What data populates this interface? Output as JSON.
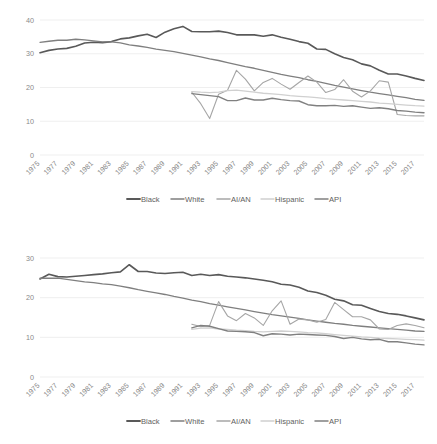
{
  "chart_data": [
    {
      "type": "line",
      "title": "",
      "xlabel": "",
      "ylabel": "",
      "ylim": [
        0,
        40
      ],
      "yticks": [
        0,
        10,
        20,
        30,
        40
      ],
      "grid": true,
      "legend_position": "bottom",
      "x": [
        1975,
        1976,
        1977,
        1978,
        1979,
        1980,
        1981,
        1982,
        1983,
        1984,
        1985,
        1986,
        1987,
        1988,
        1989,
        1990,
        1991,
        1992,
        1993,
        1994,
        1995,
        1996,
        1997,
        1998,
        1999,
        2000,
        2001,
        2002,
        2003,
        2004,
        2005,
        2006,
        2007,
        2008,
        2009,
        2010,
        2011,
        2012,
        2013,
        2014,
        2015,
        2016,
        2017,
        2018
      ],
      "xtick_labels": [
        "1975",
        "1977",
        "1979",
        "1981",
        "1983",
        "1985",
        "1987",
        "1989",
        "1991",
        "1993",
        "1995",
        "1997",
        "1999",
        "2001",
        "2003",
        "2005",
        "2007",
        "2009",
        "2011",
        "2013",
        "2015",
        "2017"
      ],
      "series": [
        {
          "name": "Black",
          "color": "#595959",
          "width": 1.6,
          "values": [
            30.3,
            31.0,
            31.4,
            31.6,
            32.2,
            33.2,
            33.4,
            33.3,
            33.6,
            34.4,
            34.7,
            35.3,
            35.8,
            34.8,
            36.4,
            37.4,
            38.1,
            36.6,
            36.5,
            36.5,
            36.7,
            36.3,
            35.6,
            35.6,
            35.6,
            35.2,
            35.6,
            34.9,
            34.3,
            33.6,
            33.1,
            31.4,
            31.3,
            30.0,
            28.9,
            28.2,
            27.0,
            26.4,
            25.1,
            24.0,
            24.0,
            23.4,
            22.7,
            22.1
          ]
        },
        {
          "name": "White",
          "color": "#7f7f7f",
          "width": 1.3,
          "values": [
            33.4,
            33.7,
            34.0,
            34.0,
            34.3,
            34.1,
            33.8,
            33.5,
            33.5,
            33.2,
            32.6,
            32.3,
            31.9,
            31.4,
            31.0,
            30.6,
            30.1,
            29.6,
            29.1,
            28.5,
            28.0,
            27.4,
            26.8,
            26.2,
            25.7,
            25.1,
            24.5,
            23.9,
            23.4,
            22.9,
            22.3,
            21.8,
            21.2,
            20.6,
            20.1,
            19.6,
            19.1,
            18.6,
            18.2,
            17.8,
            17.4,
            17.0,
            16.5,
            16.2
          ]
        },
        {
          "name": "AI/AN",
          "color": "#a6a6a6",
          "width": 1.1,
          "values": [
            null,
            null,
            null,
            null,
            null,
            null,
            null,
            null,
            null,
            null,
            null,
            null,
            null,
            null,
            null,
            null,
            null,
            18.6,
            15.2,
            10.8,
            18.0,
            19.2,
            25.1,
            22.5,
            19.0,
            21.5,
            22.7,
            21.0,
            19.5,
            21.5,
            23.4,
            21.6,
            18.5,
            19.4,
            22.3,
            18.9,
            17.2,
            19.0,
            22.0,
            21.6,
            12.0,
            11.7,
            11.6,
            11.6
          ]
        },
        {
          "name": "Hispanic",
          "color": "#d0d0d0",
          "width": 1.3,
          "values": [
            null,
            null,
            null,
            null,
            null,
            null,
            null,
            null,
            null,
            null,
            null,
            null,
            null,
            null,
            null,
            null,
            null,
            18.8,
            18.6,
            18.5,
            18.6,
            19.1,
            19.2,
            18.9,
            18.6,
            18.3,
            18.1,
            17.9,
            17.6,
            17.4,
            17.2,
            17.0,
            16.7,
            16.5,
            16.3,
            16.1,
            15.9,
            15.7,
            15.4,
            15.2,
            15.0,
            14.8,
            14.6,
            14.5
          ]
        },
        {
          "name": "API",
          "color": "#808080",
          "width": 1.4,
          "values": [
            null,
            null,
            null,
            null,
            null,
            null,
            null,
            null,
            null,
            null,
            null,
            null,
            null,
            null,
            null,
            null,
            null,
            18.2,
            17.9,
            17.6,
            17.3,
            16.1,
            16.1,
            16.9,
            16.3,
            16.3,
            16.8,
            16.4,
            16.1,
            16.0,
            14.9,
            14.6,
            14.6,
            14.7,
            14.4,
            14.6,
            14.2,
            13.8,
            14.0,
            13.7,
            13.2,
            13.0,
            12.7,
            12.5
          ]
        }
      ]
    },
    {
      "type": "line",
      "title": "",
      "xlabel": "",
      "ylabel": "",
      "ylim": [
        0,
        30
      ],
      "yticks": [
        0,
        10,
        20,
        30
      ],
      "grid": true,
      "legend_position": "bottom",
      "x": [
        1975,
        1976,
        1977,
        1978,
        1979,
        1980,
        1981,
        1982,
        1983,
        1984,
        1985,
        1986,
        1987,
        1988,
        1989,
        1990,
        1991,
        1992,
        1993,
        1994,
        1995,
        1996,
        1997,
        1998,
        1999,
        2000,
        2001,
        2002,
        2003,
        2004,
        2005,
        2006,
        2007,
        2008,
        2009,
        2010,
        2011,
        2012,
        2013,
        2014,
        2015,
        2016,
        2017,
        2018
      ],
      "xtick_labels": [
        "1975",
        "1977",
        "1979",
        "1981",
        "1983",
        "1985",
        "1987",
        "1989",
        "1991",
        "1993",
        "1995",
        "1997",
        "1999",
        "2001",
        "2003",
        "2005",
        "2007",
        "2009",
        "2011",
        "2013",
        "2015",
        "2017"
      ],
      "series": [
        {
          "name": "Black",
          "color": "#595959",
          "width": 1.6,
          "values": [
            24.7,
            25.9,
            25.3,
            25.2,
            25.4,
            25.6,
            25.8,
            26.0,
            26.3,
            26.5,
            28.3,
            26.6,
            26.6,
            26.2,
            26.1,
            26.3,
            26.4,
            25.6,
            25.9,
            25.6,
            25.8,
            25.4,
            25.2,
            25.0,
            24.7,
            24.4,
            24.0,
            23.4,
            23.2,
            22.6,
            21.7,
            21.3,
            20.6,
            19.6,
            19.2,
            18.2,
            18.1,
            17.3,
            16.5,
            16.0,
            15.8,
            15.4,
            14.9,
            14.4
          ]
        },
        {
          "name": "White",
          "color": "#7f7f7f",
          "width": 1.3,
          "values": [
            24.9,
            24.9,
            24.9,
            24.6,
            24.3,
            24.0,
            23.8,
            23.5,
            23.3,
            22.9,
            22.5,
            22.0,
            21.6,
            21.2,
            20.8,
            20.3,
            19.9,
            19.4,
            19.0,
            18.5,
            18.1,
            17.7,
            17.3,
            16.9,
            16.5,
            16.1,
            15.7,
            15.4,
            15.1,
            14.8,
            14.4,
            14.1,
            13.8,
            13.5,
            13.3,
            13.0,
            12.8,
            12.6,
            12.4,
            12.2,
            12.0,
            11.8,
            11.6,
            11.5
          ]
        },
        {
          "name": "AI/AN",
          "color": "#a6a6a6",
          "width": 1.1,
          "values": [
            null,
            null,
            null,
            null,
            null,
            null,
            null,
            null,
            null,
            null,
            null,
            null,
            null,
            null,
            null,
            null,
            null,
            13.3,
            12.7,
            13.0,
            19.0,
            15.4,
            14.2,
            16.0,
            14.9,
            13.0,
            16.7,
            19.2,
            13.3,
            14.6,
            14.4,
            13.8,
            14.5,
            18.8,
            17.0,
            15.2,
            15.2,
            14.4,
            12.1,
            12.0,
            13.0,
            13.4,
            13.0,
            12.4
          ]
        },
        {
          "name": "Hispanic",
          "color": "#d0d0d0",
          "width": 1.3,
          "values": [
            null,
            null,
            null,
            null,
            null,
            null,
            null,
            null,
            null,
            null,
            null,
            null,
            null,
            null,
            null,
            null,
            null,
            12.0,
            12.3,
            12.4,
            12.1,
            12.0,
            11.8,
            11.7,
            11.5,
            11.4,
            11.5,
            11.6,
            11.5,
            11.4,
            11.2,
            11.1,
            10.9,
            10.7,
            10.5,
            10.3,
            10.1,
            10.0,
            9.8,
            9.7,
            9.6,
            9.5,
            9.4,
            9.3
          ]
        },
        {
          "name": "API",
          "color": "#808080",
          "width": 1.4,
          "values": [
            null,
            null,
            null,
            null,
            null,
            null,
            null,
            null,
            null,
            null,
            null,
            null,
            null,
            null,
            null,
            null,
            null,
            12.4,
            13.0,
            12.8,
            12.2,
            11.6,
            11.5,
            11.4,
            11.2,
            10.4,
            10.9,
            10.8,
            10.6,
            10.8,
            10.7,
            10.6,
            10.5,
            10.2,
            9.7,
            10.0,
            9.6,
            9.4,
            9.5,
            8.9,
            8.9,
            8.6,
            8.3,
            8.1
          ]
        }
      ]
    }
  ],
  "legend": {
    "entries": [
      {
        "label": "Black",
        "color": "#595959"
      },
      {
        "label": "White",
        "color": "#7f7f7f"
      },
      {
        "label": "AI/AN",
        "color": "#a6a6a6"
      },
      {
        "label": "Hispanic",
        "color": "#d0d0d0"
      },
      {
        "label": "API",
        "color": "#808080"
      }
    ]
  }
}
